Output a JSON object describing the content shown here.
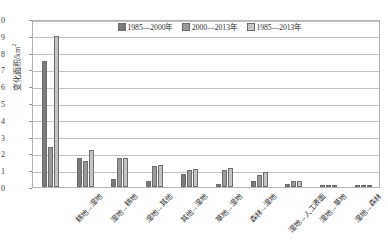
{
  "chart_data": {
    "type": "bar",
    "title": "",
    "xlabel": "",
    "ylabel": "变化面积/km²",
    "ylim": [
      0,
      10
    ],
    "ytick_labels": [
      "0",
      "1",
      "2",
      "3",
      "4",
      "5",
      "6",
      "7",
      "8",
      "9",
      "10"
    ],
    "grid": true,
    "legend_position": "top-center",
    "categories": [
      "耕地→湿地",
      "湿地→耕地",
      "湿地→其他",
      "其他→湿地",
      "草地→湿地",
      "森林→湿地",
      "湿地→人工表面",
      "湿地→草地",
      "湿地→森林",
      "人工表面→湿地"
    ],
    "series": [
      {
        "name": "1985—2000年",
        "color": "#7b7b7b",
        "values": [
          7.5,
          1.75,
          0.5,
          0.35,
          0.75,
          0.2,
          0.35,
          0.2,
          0.1,
          0.04
        ]
      },
      {
        "name": "2000—2013年",
        "color": "#9a9a9a",
        "values": [
          2.4,
          1.55,
          1.7,
          1.25,
          1.0,
          1.0,
          0.7,
          0.35,
          0.05,
          0.06
        ]
      },
      {
        "name": "1985—2013年",
        "color": "#c4c4c4",
        "values": [
          9.0,
          2.2,
          1.7,
          1.3,
          1.1,
          1.15,
          0.9,
          0.35,
          0.12,
          0.08
        ]
      }
    ]
  },
  "axis": {
    "y_title_main": "变化面积/km",
    "y_title_sup": "2"
  }
}
